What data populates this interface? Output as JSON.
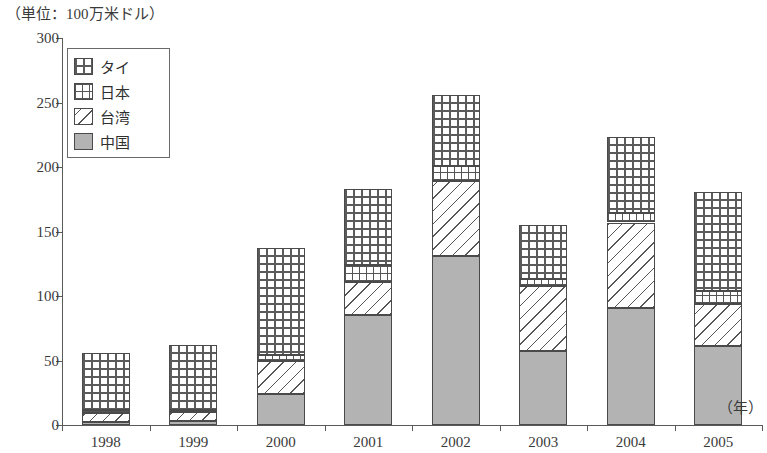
{
  "caption": "（単位：100万米ドル）",
  "axis_unit_label": "（年）",
  "legend": {
    "items": [
      {
        "key": "thailand",
        "label": "タイ",
        "pattern": "dotted-grid"
      },
      {
        "key": "japan",
        "label": "日本",
        "pattern": "crosshatch-grid"
      },
      {
        "key": "taiwan",
        "label": "台湾",
        "pattern": "diagonal-hatch"
      },
      {
        "key": "china",
        "label": "中国",
        "pattern": "solid-gray",
        "color": "#b3b3b3"
      }
    ]
  },
  "y_axis": {
    "ticks": [
      "0",
      "50",
      "100",
      "150",
      "200",
      "250",
      "300"
    ],
    "min": 0,
    "max": 300,
    "step": 50
  },
  "chart_data": {
    "type": "bar",
    "stacked": true,
    "title": "",
    "subtitle": "",
    "xlabel": "（年）",
    "ylabel": "（単位：100万米ドル）",
    "ylim": [
      0,
      300
    ],
    "grid": false,
    "legend_position": "top-left-inside",
    "categories": [
      "1998",
      "1999",
      "2000",
      "2001",
      "2002",
      "2003",
      "2004",
      "2005"
    ],
    "series": [
      {
        "name": "中国",
        "values": [
          2,
          3,
          24,
          85,
          131,
          57,
          91,
          61
        ]
      },
      {
        "name": "台湾",
        "values": [
          7,
          7,
          26,
          26,
          58,
          51,
          66,
          33
        ]
      },
      {
        "name": "日本",
        "values": [
          3,
          2,
          4,
          13,
          12,
          5,
          7,
          10
        ]
      },
      {
        "name": "タイ",
        "values": [
          44,
          50,
          83,
          59,
          55,
          42,
          59,
          77
        ]
      }
    ],
    "totals": [
      56,
      62,
      137,
      183,
      256,
      155,
      223,
      181
    ]
  }
}
